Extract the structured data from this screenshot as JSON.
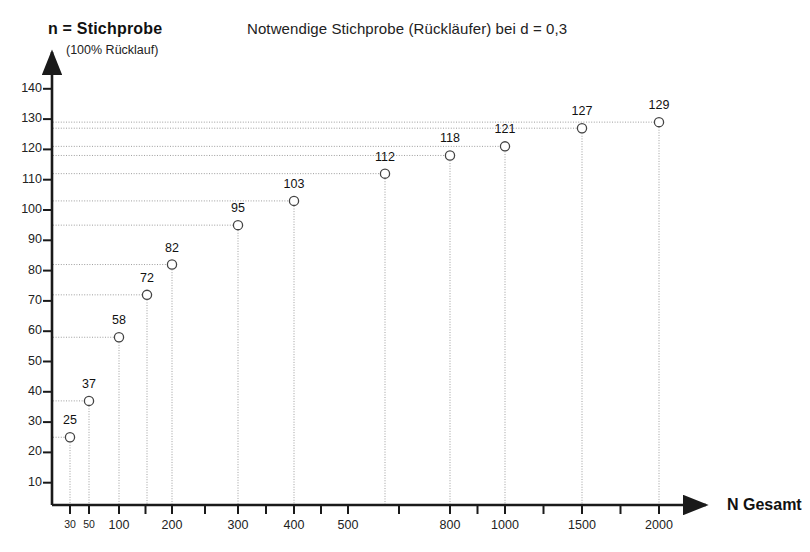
{
  "chart_data": {
    "type": "scatter",
    "title": "Notwendige Stichprobe (Rückläufer) bei d = 0,3",
    "ylabel": "n = Stichprobe",
    "ylabel_sub": "(100% Rücklauf)",
    "xlabel": "N  Gesamt",
    "categories": [
      "30",
      "50",
      "100",
      "150",
      "200",
      "300",
      "400",
      "600",
      "800",
      "1000",
      "1500",
      "2000"
    ],
    "x_tick_labels": [
      "30",
      "50",
      "100",
      "",
      "200",
      "300",
      "400",
      "500",
      "",
      "800",
      "1000",
      "",
      "1500",
      "",
      "2000"
    ],
    "values": [
      25,
      37,
      58,
      72,
      82,
      95,
      103,
      112,
      118,
      121,
      127,
      129
    ],
    "point_labels": [
      "25",
      "37",
      "58",
      "72",
      "82",
      "95",
      "103",
      "112",
      "118",
      "121",
      "127",
      "129"
    ],
    "y_ticks": [
      140,
      130,
      120,
      110,
      100,
      90,
      80,
      70,
      60,
      50,
      40,
      30,
      20,
      10
    ],
    "ylim": [
      0,
      145
    ],
    "grid": false,
    "legend": "none",
    "marker": "open-circle",
    "drop_lines": true,
    "leader_lines": true,
    "colors": {
      "axis": "#1a1a1a",
      "marker_stroke": "#444444",
      "guide_line": "#9a9a9a",
      "text": "#1a1a1a"
    }
  },
  "axis_geometry": {
    "x_labeled_ticks": [
      {
        "label": "30",
        "x": 70
      },
      {
        "label": "50",
        "x": 89
      },
      {
        "label": "100",
        "x": 119
      },
      {
        "label": "200",
        "x": 172
      },
      {
        "label": "300",
        "x": 238
      },
      {
        "label": "400",
        "x": 294
      },
      {
        "label": "500",
        "x": 348
      },
      {
        "label": "800",
        "x": 450
      },
      {
        "label": "1000",
        "x": 505
      },
      {
        "label": "1500",
        "x": 582
      },
      {
        "label": "2000",
        "x": 659
      }
    ],
    "points_px": [
      {
        "label": "25",
        "x": 70,
        "y": 437
      },
      {
        "label": "37",
        "x": 89,
        "y": 400
      },
      {
        "label": "58",
        "x": 119,
        "y": 332
      },
      {
        "label": "72",
        "x": 147,
        "y": 290
      },
      {
        "label": "82",
        "x": 172,
        "y": 259
      },
      {
        "label": "95",
        "x": 238,
        "y": 220
      },
      {
        "label": "103",
        "x": 294,
        "y": 194
      },
      {
        "label": "112",
        "x": 385,
        "y": 164
      },
      {
        "label": "118",
        "x": 450,
        "y": 144
      },
      {
        "label": "121",
        "x": 505,
        "y": 134
      },
      {
        "label": "127",
        "x": 582,
        "y": 116
      },
      {
        "label": "129",
        "x": 659,
        "y": 108
      }
    ]
  }
}
